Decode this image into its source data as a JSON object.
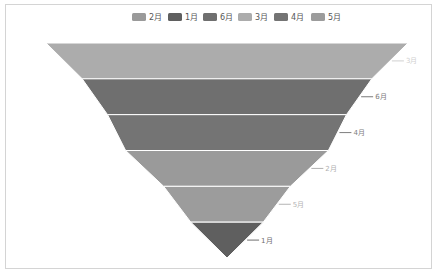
{
  "chart_data": {
    "type": "funnel",
    "title": "",
    "sort": "descending",
    "legend": {
      "placement": "top-center",
      "entries": [
        "2月",
        "1月",
        "6月",
        "3月",
        "4月",
        "5月"
      ]
    },
    "series": [
      {
        "name": "2月",
        "value": 56,
        "color": "#9a9a9a",
        "label_color": "#b0b0b0"
      },
      {
        "name": "1月",
        "value": 20,
        "color": "#5f5f5f",
        "label_color": "#6e6e6e"
      },
      {
        "name": "6月",
        "value": 80,
        "color": "#6f6f6f",
        "label_color": "#7a7a7a"
      },
      {
        "name": "3月",
        "value": 100,
        "color": "#acacac",
        "label_color": "#d0d0d0"
      },
      {
        "name": "4月",
        "value": 66,
        "color": "#747474",
        "label_color": "#7e7e7e"
      },
      {
        "name": "5月",
        "value": 35,
        "color": "#9c9c9c",
        "label_color": "#b4b4b4"
      }
    ],
    "label_position": "right",
    "max": 100,
    "min": 0
  }
}
